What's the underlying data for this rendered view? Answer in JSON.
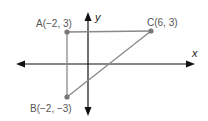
{
  "diagram": {
    "type": "coordinate-plane-triangle",
    "axes": {
      "x_label": "x",
      "y_label": "y"
    },
    "points": [
      {
        "name": "A",
        "label": "A(−2, 3)",
        "x": -2,
        "y": 3
      },
      {
        "name": "B",
        "label": "B(−2, −3)",
        "x": -2,
        "y": -3
      },
      {
        "name": "C",
        "label": "C(6, 3)",
        "x": 6,
        "y": 3
      }
    ],
    "segments": [
      [
        "A",
        "C"
      ],
      [
        "A",
        "B"
      ],
      [
        "B",
        "C"
      ]
    ],
    "colors": {
      "triangle": "#888888",
      "point": "#777777",
      "axis": "#111111",
      "label": "#555555"
    }
  }
}
